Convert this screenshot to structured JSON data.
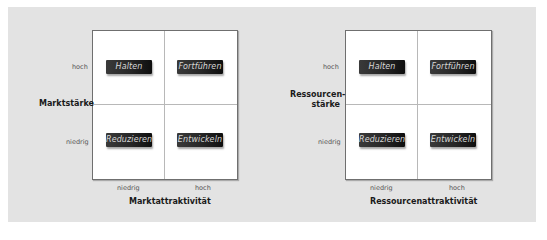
{
  "diagrams": [
    {
      "y_axis_label": "Marktstärke",
      "x_axis_label": "Marktattraktivität",
      "y_ticks": {
        "high": "hoch",
        "low": "niedrig"
      },
      "x_ticks": {
        "low": "niedrig",
        "high": "hoch"
      },
      "quadrants": {
        "top_left": "Halten",
        "top_right": "Fortführen",
        "bottom_left": "Reduzieren",
        "bottom_right": "Entwickeln"
      }
    },
    {
      "y_axis_label_line1": "Ressourcen-",
      "y_axis_label_line2": "stärke",
      "x_axis_label": "Ressourcenattraktivität",
      "y_ticks": {
        "high": "hoch",
        "low": "niedrig"
      },
      "x_ticks": {
        "low": "niedrig",
        "high": "hoch"
      },
      "quadrants": {
        "top_left": "Halten",
        "top_right": "Fortführen",
        "bottom_left": "Reduzieren",
        "bottom_right": "Entwickeln"
      }
    }
  ],
  "colors": {
    "panel_background": "#e3e3e3",
    "grid_background": "#ffffff",
    "button_dark": "#1a1a1a",
    "button_text": "#d8d8d8"
  }
}
